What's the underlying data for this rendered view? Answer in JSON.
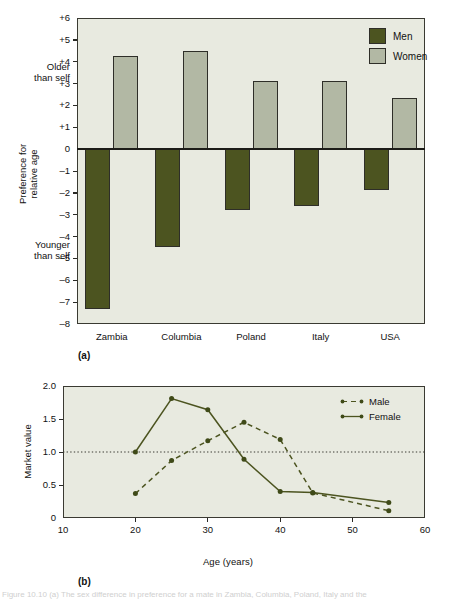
{
  "figure": {
    "caption": "Figure 10.10 (a) The sex difference in preference for a mate in Zambia, Columbia, Poland, Italy and the"
  },
  "panel_a": {
    "tag": "(a)",
    "axis_title_lines": [
      "Preference for",
      "relative age"
    ],
    "note_upper": [
      "Older",
      "than self"
    ],
    "note_lower": [
      "Younger",
      "than self"
    ],
    "y_ticks": [
      "+6",
      "+5",
      "+4",
      "+3",
      "+2",
      "+1",
      "0",
      "–1",
      "–2",
      "–3",
      "–4",
      "–5",
      "–6",
      "–7",
      "–8"
    ],
    "categories": [
      "Zambia",
      "Columbia",
      "Poland",
      "Italy",
      "USA"
    ],
    "legend": [
      {
        "label": "Men",
        "color": "#4c5420"
      },
      {
        "label": "Women",
        "color": "#b2b8a4"
      }
    ]
  },
  "panel_b": {
    "tag": "(b)",
    "y_axis_label": "Market value",
    "x_axis_label": "Age (years)",
    "y_ticks": [
      "2.0",
      "1.5",
      "1.0",
      "0.5",
      "0"
    ],
    "x_ticks": [
      "10",
      "20",
      "30",
      "40",
      "50",
      "60"
    ],
    "legend": [
      {
        "label": "Male",
        "style": "dashed"
      },
      {
        "label": "Female",
        "style": "solid"
      }
    ]
  },
  "colors": {
    "men": "#4c5420",
    "women": "#b2b8a4",
    "plot_background": "#e8eae0",
    "frame": "#3a3a32",
    "line": "#4c5420"
  },
  "chart_data": [
    {
      "type": "bar",
      "title": "",
      "xlabel": "",
      "ylabel": "Preference for relative age",
      "categories": [
        "Zambia",
        "Columbia",
        "Poland",
        "Italy",
        "USA"
      ],
      "ylim": [
        -8,
        6
      ],
      "grid": false,
      "legend_position": "top-right",
      "series": [
        {
          "name": "Men",
          "color": "#4c5420",
          "values": [
            -7.3,
            -4.5,
            -2.8,
            -2.6,
            -1.85
          ]
        },
        {
          "name": "Women",
          "color": "#b2b8a4",
          "values": [
            4.25,
            4.5,
            3.1,
            3.1,
            2.35
          ]
        }
      ]
    },
    {
      "type": "line",
      "title": "",
      "xlabel": "Age (years)",
      "ylabel": "Market value",
      "xlim": [
        10,
        60
      ],
      "ylim": [
        0,
        2.0
      ],
      "grid": false,
      "reference_line_y": 1.0,
      "legend_position": "top-right",
      "series": [
        {
          "name": "Male",
          "style": "dashed",
          "color": "#4c5420",
          "x": [
            20,
            25,
            30,
            35,
            40,
            44.5,
            55
          ],
          "y": [
            0.37,
            0.87,
            1.17,
            1.45,
            1.19,
            0.38,
            0.11
          ]
        },
        {
          "name": "Female",
          "style": "solid",
          "color": "#4c5420",
          "x": [
            20,
            25,
            30,
            35,
            40,
            44.5,
            55
          ],
          "y": [
            1.0,
            1.81,
            1.64,
            0.89,
            0.4,
            0.385,
            0.235
          ]
        }
      ]
    }
  ]
}
